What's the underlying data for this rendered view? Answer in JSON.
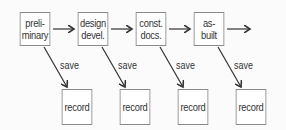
{
  "diagram": {
    "stages": [
      {
        "label_line1": "preli-",
        "label_line2": "minary"
      },
      {
        "label_line1": "design",
        "label_line2": "devel."
      },
      {
        "label_line1": "const.",
        "label_line2": "docs."
      },
      {
        "label_line1": "as-",
        "label_line2": "built"
      }
    ],
    "edge_label": "save",
    "save_labels": [
      "save",
      "save",
      "save",
      "save"
    ],
    "records": [
      "record",
      "record",
      "record",
      "record"
    ]
  }
}
